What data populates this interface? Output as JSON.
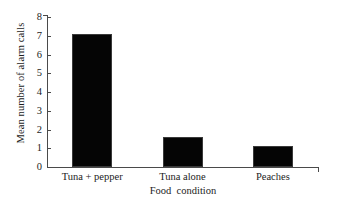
{
  "chart_data": {
    "type": "bar",
    "title": "",
    "xlabel": "Food  condition",
    "ylabel": "Mean number of alarm calls",
    "categories": [
      "Tuna + pepper",
      "Tuna alone",
      "Peaches"
    ],
    "values": [
      7.1,
      1.6,
      1.1
    ],
    "ylim": [
      0,
      8
    ],
    "yticks": [
      0,
      1,
      2,
      3,
      4,
      5,
      6,
      7,
      8
    ],
    "ytick_labels": [
      "0",
      "1",
      "2",
      "3",
      "4",
      "5",
      "6",
      "7",
      "8"
    ],
    "grid": false,
    "legend": false,
    "legend_position": "none",
    "bar_color": "#050505",
    "axis_color": "#4a4a4a",
    "background_color": "#ffffff",
    "text_color": "#1c1c1c"
  }
}
